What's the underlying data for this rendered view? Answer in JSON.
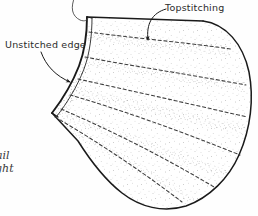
{
  "figure": {
    "kind": "hand-drawn sewing illustration"
  },
  "annotations": {
    "topstitching": {
      "label": "Topstitching",
      "leader": "curved-arrow-down"
    },
    "unstitched_edge": {
      "label": "Unstitched edge",
      "leader": "curved-arrow-down-right"
    }
  },
  "caption_fragments": {
    "line1": "ail",
    "line2": "ght"
  },
  "colors": {
    "ink": "#1a1a1a",
    "stipple": "#8a8a8a",
    "stitch": "#3d3d3d",
    "paper": "#fefefe",
    "text": "#2b2b2b"
  },
  "stitch_rows": {
    "count": 6,
    "style": "dashed"
  }
}
